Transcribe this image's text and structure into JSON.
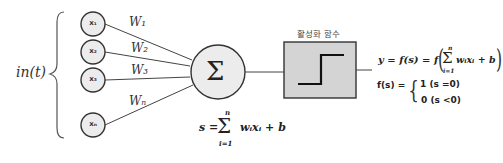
{
  "diagram": {
    "type": "perceptron",
    "input_group_label": "in(t)",
    "inputs": [
      {
        "label": "x₁",
        "weight": "W₁"
      },
      {
        "label": "x₂",
        "weight": "W₂"
      },
      {
        "label": "x₃",
        "weight": "W₃"
      },
      {
        "label": "xₙ",
        "weight": "Wₙ"
      }
    ],
    "sum_node": {
      "symbol": "Σ"
    },
    "weighted_sum_formula": {
      "lhs": "s =",
      "sum_top": "n",
      "sum_symbol": "Σ",
      "sum_bottom": "i=1",
      "rhs": "wᵢxᵢ + b"
    },
    "activation": {
      "title": "활성화 함수",
      "shape": "step-function",
      "box_color": "#d4d4d4"
    },
    "output_formula": {
      "text": "y = f(s) = f",
      "inner_top": "n",
      "inner_symbol": "Σ",
      "inner_bottom": "i=1",
      "inner_rhs": "wᵢxᵢ + b"
    },
    "piecewise": {
      "lhs": "f(s) =",
      "cases": [
        "1 (s =0)",
        "0 (s <0)"
      ]
    }
  }
}
